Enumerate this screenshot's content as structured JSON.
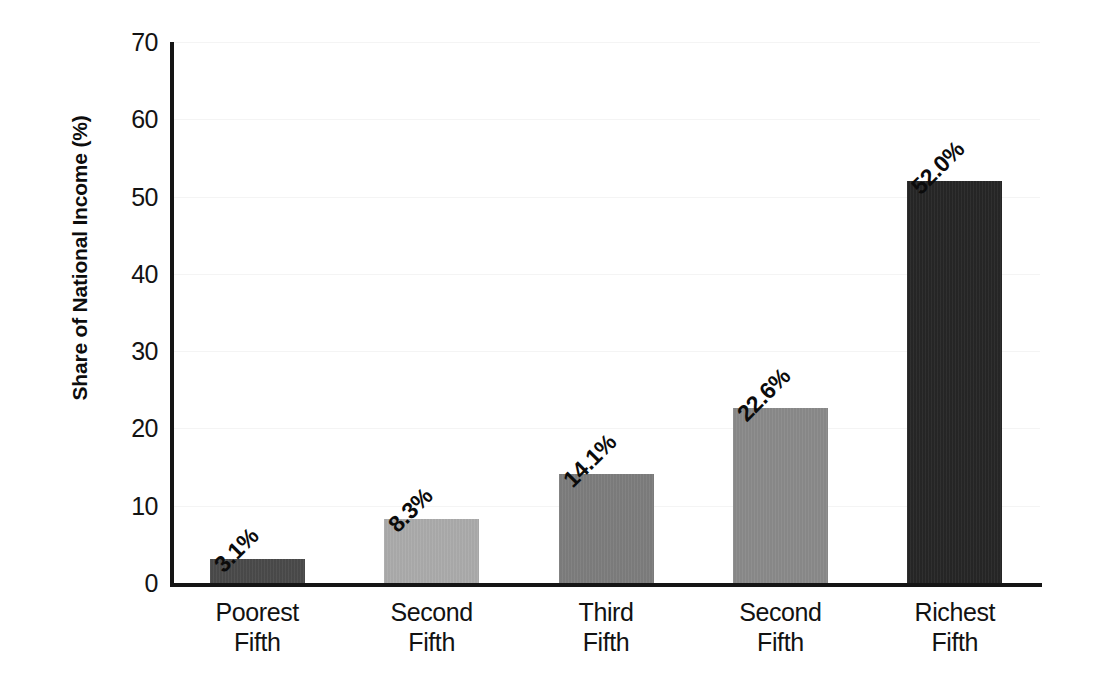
{
  "chart_data": {
    "type": "bar",
    "title": "",
    "xlabel": "",
    "ylabel": "Share of National Income (%)",
    "ylim": [
      0,
      70
    ],
    "ytick_step": 10,
    "grid": true,
    "grid_axis": "y",
    "legend": false,
    "categories": [
      "Poorest Fifth",
      "Second Fifth",
      "Third Fifth",
      "Second Fifth",
      "Richest Fifth"
    ],
    "category_lines": [
      [
        "Poorest",
        "Fifth"
      ],
      [
        "Second",
        "Fifth"
      ],
      [
        "Third",
        "Fifth"
      ],
      [
        "Second",
        "Fifth"
      ],
      [
        "Richest",
        "Fifth"
      ]
    ],
    "values": [
      3.1,
      8.3,
      14.1,
      22.6,
      52.0
    ],
    "data_labels": [
      "3.1%",
      "8.3%",
      "14.1%",
      "22.6%",
      "52.0%"
    ],
    "data_label_rotation_deg": 45,
    "bar_colors": [
      "#4a4a4a",
      "#ababab",
      "#7d7d7d",
      "#8a8a8a",
      "#262626"
    ],
    "ytick_labels": [
      "0",
      "10",
      "20",
      "30",
      "40",
      "50",
      "60",
      "70"
    ],
    "ytick_values": [
      0,
      10,
      20,
      30,
      40,
      50,
      60,
      70
    ]
  },
  "axes": {
    "axis_color": "#151515",
    "gridline_color": "#f4f4f4",
    "text_color": "#121212"
  },
  "bars": [
    {
      "label": "Poorest Fifth",
      "line1": "Poorest",
      "line2": "Fifth",
      "value": 3.1,
      "value_label": "3.1%",
      "color": "#4a4a4a"
    },
    {
      "label": "Second Fifth",
      "line1": "Second",
      "line2": "Fifth",
      "value": 8.3,
      "value_label": "8.3%",
      "color": "#ababab"
    },
    {
      "label": "Third Fifth",
      "line1": "Third",
      "line2": "Fifth",
      "value": 14.1,
      "value_label": "14.1%",
      "color": "#7d7d7d"
    },
    {
      "label": "Second Fifth",
      "line1": "Second",
      "line2": "Fifth",
      "value": 22.6,
      "value_label": "22.6%",
      "color": "#8a8a8a"
    },
    {
      "label": "Richest Fifth",
      "line1": "Richest",
      "line2": "Fifth",
      "value": 52.0,
      "value_label": "52.0%",
      "color": "#262626"
    }
  ],
  "yticks": [
    {
      "label": "70",
      "value": 70
    },
    {
      "label": "60",
      "value": 60
    },
    {
      "label": "50",
      "value": 50
    },
    {
      "label": "40",
      "value": 40
    },
    {
      "label": "30",
      "value": 30
    },
    {
      "label": "20",
      "value": 20
    },
    {
      "label": "10",
      "value": 10
    },
    {
      "label": "0",
      "value": 0
    }
  ]
}
